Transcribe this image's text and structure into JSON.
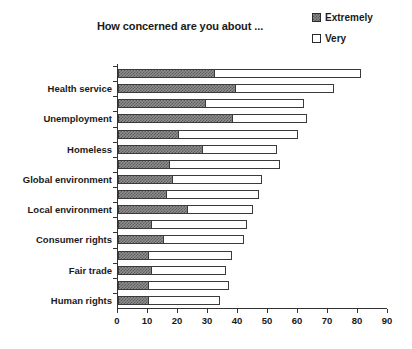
{
  "chart_data": {
    "type": "bar",
    "orientation": "horizontal",
    "stacked": true,
    "title": "How concerned are you about ...",
    "xlabel": "",
    "ylabel": "",
    "xlim": [
      0,
      90
    ],
    "xticks": [
      0,
      10,
      20,
      30,
      40,
      50,
      60,
      70,
      80,
      90
    ],
    "xtick_labels": [
      "0",
      "10",
      "20",
      "30",
      "40",
      "50",
      "60",
      "70",
      "80",
      "90"
    ],
    "grid": false,
    "legend_position": "top-right",
    "legend": [
      "Extremely",
      "Very"
    ],
    "categories": [
      "",
      "Health service",
      "",
      "Unemployment",
      "",
      "Homeless",
      "",
      "Global environment",
      "",
      "Local environment",
      "",
      "Consumer rights",
      "",
      "Fair trade",
      "",
      "Human rights"
    ],
    "visible_category_labels": [
      "Health service",
      "Unemployment",
      "Homeless",
      "Global environment",
      "Local environment",
      "Consumer rights",
      "Fair trade",
      "Human rights"
    ],
    "series": [
      {
        "name": "Extremely",
        "color": "#8e8e8e",
        "values": [
          32,
          39,
          29,
          38,
          20,
          28,
          17,
          18,
          16,
          23,
          11,
          15,
          10,
          11,
          10,
          10
        ]
      },
      {
        "name": "Very",
        "color": "#ffffff",
        "values": [
          49,
          33,
          33,
          25,
          40,
          25,
          37,
          30,
          31,
          22,
          32,
          27,
          28,
          25,
          27,
          24
        ]
      }
    ],
    "totals": [
      81,
      72,
      62,
      63,
      60,
      53,
      54,
      48,
      47,
      45,
      43,
      42,
      38,
      36,
      37,
      34
    ]
  },
  "legend": {
    "items": [
      {
        "label": "Extremely",
        "swatch": "hatched-dark"
      },
      {
        "label": "Very",
        "swatch": "white"
      }
    ]
  },
  "axis": {
    "x_tick_labels": [
      "0",
      "10",
      "20",
      "30",
      "40",
      "50",
      "60",
      "70",
      "80",
      "90"
    ]
  },
  "footer": {
    "artifact_text": ""
  }
}
